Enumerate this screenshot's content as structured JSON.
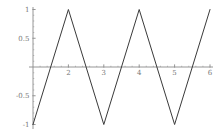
{
  "chart_data": {
    "type": "line",
    "title": "",
    "xlabel": "",
    "ylabel": "",
    "grid": false,
    "legend": null,
    "xlim": [
      1,
      6
    ],
    "ylim": [
      -1,
      1
    ],
    "series": [
      {
        "name": "triangle-wave",
        "points": [
          [
            1,
            -1
          ],
          [
            2,
            1
          ],
          [
            3,
            -1
          ],
          [
            4,
            1
          ],
          [
            5,
            -1
          ],
          [
            6,
            1
          ]
        ]
      }
    ],
    "x_ticks": [
      {
        "value": 2,
        "label": "2"
      },
      {
        "value": 3,
        "label": "3"
      },
      {
        "value": 4,
        "label": "4"
      },
      {
        "value": 5,
        "label": "5"
      },
      {
        "value": 6,
        "label": "6"
      }
    ],
    "y_ticks": [
      {
        "value": 1,
        "label": "1"
      },
      {
        "value": 0.5,
        "label": "0.5"
      },
      {
        "value": -0.5,
        "label": "-0.5"
      },
      {
        "value": -1,
        "label": "-1"
      }
    ],
    "x_minor_step": 0.2,
    "y_minor_step": 0.1,
    "colors": {
      "background": "#ffffff",
      "curve": "#3a3a3a",
      "axis": "#8a8a8a",
      "minor_tick": "#aaaaaa",
      "tick_label": "#777777"
    }
  }
}
